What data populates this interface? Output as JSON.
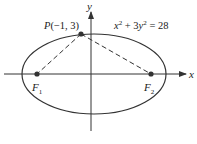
{
  "diagram": {
    "equation": {
      "text_x": "x",
      "sup_x": "2",
      "text_mid": " + 3",
      "text_y": "y",
      "sup_y": "2",
      "text_rhs": " = 28"
    },
    "point_p": {
      "name": "P",
      "coords": "(−1, 3)"
    },
    "focus_1": {
      "name": "F",
      "sub": "1"
    },
    "focus_2": {
      "name": "F",
      "sub": "2"
    },
    "axis_x_label": "x",
    "axis_y_label": "y",
    "colors": {
      "stroke": "#333333",
      "dashed": "#333333",
      "point": "#333333"
    }
  }
}
